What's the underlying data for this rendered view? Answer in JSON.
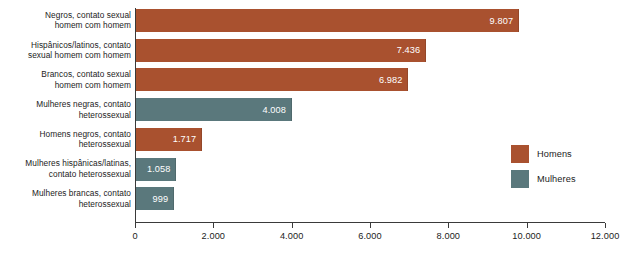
{
  "chart_data": {
    "type": "bar",
    "orientation": "horizontal",
    "title": "",
    "xlabel": "",
    "ylabel": "",
    "xlim": [
      0,
      12000
    ],
    "grid": false,
    "legend_position": "right",
    "tick_labels": [
      "0",
      "2.000",
      "4.000",
      "6.000",
      "8.000",
      "10.000",
      "12.000"
    ],
    "tick_values": [
      0,
      2000,
      4000,
      6000,
      8000,
      10000,
      12000
    ],
    "categories": [
      "Negros, contato sexual\nhomem com homem",
      "Hispânicos/latinos, contato\nsexual homem com homem",
      "Brancos, contato sexual\nhomem com homem",
      "Mulheres negras, contato\nheterossexual",
      "Homens negros, contato\nheterossexual",
      "Mulheres hispânicas/latinas,\ncontato heterossexual",
      "Mulheres brancas, contato\nheterossexual"
    ],
    "values": [
      9807,
      7436,
      6982,
      4008,
      1717,
      1058,
      999
    ],
    "value_labels": [
      "9.807",
      "7.436",
      "6.982",
      "4.008",
      "1.717",
      "1.058",
      "999"
    ],
    "groups": [
      "Homens",
      "Homens",
      "Homens",
      "Mulheres",
      "Homens",
      "Mulheres",
      "Mulheres"
    ],
    "legend": [
      {
        "label": "Homens",
        "color": "#A9512F"
      },
      {
        "label": "Mulheres",
        "color": "#5A787C"
      }
    ],
    "colors": {
      "homens": "#A9512F",
      "mulheres": "#5A787C",
      "axis": "#3a3a3a",
      "text": "#1c1c1c",
      "value_text": "#ffffff",
      "background": "#ffffff"
    }
  }
}
